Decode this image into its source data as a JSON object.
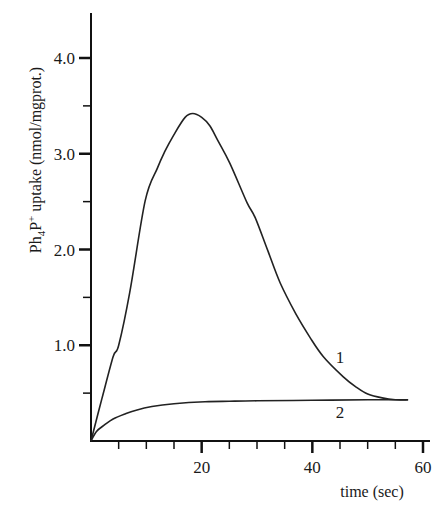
{
  "chart_data": {
    "type": "line",
    "title": "",
    "xlabel": "time (sec)",
    "ylabel": "Ph4P+ uptake (nmol/mgprot.)",
    "ylabel_parts": {
      "base": "Ph",
      "sub": "4",
      "mid": "P",
      "sup": "+",
      "rest": " uptake (nmol/mgprot.)"
    },
    "xlim": [
      0,
      60
    ],
    "ylim": [
      0,
      4.0
    ],
    "grid": false,
    "legend": "inline labels",
    "x_ticks_major": [
      20,
      40,
      60
    ],
    "x_tick_labels": [
      "20",
      "40",
      "60"
    ],
    "x_ticks_minor": [
      5,
      10,
      15,
      25,
      30,
      35,
      45,
      50,
      55
    ],
    "y_ticks_major": [
      1.0,
      2.0,
      3.0,
      4.0
    ],
    "y_tick_labels": [
      "1.0",
      "2.0",
      "3.0",
      "4.0"
    ],
    "y_ticks_minor": [
      0.5,
      1.5,
      2.5,
      3.5
    ],
    "series": [
      {
        "name": "1",
        "label_pos": {
          "x": 45.0,
          "y": 0.88
        },
        "x": [
          0,
          2,
          4,
          5,
          7,
          9.8,
          12,
          13.4,
          15,
          17,
          18.4,
          20,
          21.5,
          23,
          25.1,
          28.2,
          29.7,
          32,
          34.2,
          37,
          39.6,
          42,
          45.6,
          48,
          50,
          52.6,
          55,
          57.3
        ],
        "values": [
          0,
          0.45,
          0.88,
          1.0,
          1.55,
          2.51,
          2.85,
          3.03,
          3.2,
          3.38,
          3.42,
          3.38,
          3.29,
          3.13,
          2.9,
          2.49,
          2.33,
          1.98,
          1.65,
          1.33,
          1.08,
          0.88,
          0.67,
          0.56,
          0.49,
          0.45,
          0.43,
          0.43
        ]
      },
      {
        "name": "2",
        "label_pos": {
          "x": 45.0,
          "y": 0.3
        },
        "x": [
          0,
          1,
          2.5,
          4,
          6,
          8,
          11,
          15,
          20.6,
          25,
          30,
          40,
          50,
          57.3
        ],
        "values": [
          0,
          0.1,
          0.17,
          0.23,
          0.28,
          0.32,
          0.36,
          0.39,
          0.41,
          0.415,
          0.42,
          0.425,
          0.43,
          0.43
        ]
      }
    ],
    "colors": {
      "line": "#222222",
      "axis": "#111111",
      "background": "#ffffff"
    }
  }
}
